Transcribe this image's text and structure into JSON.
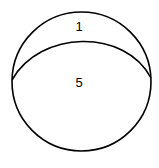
{
  "diagram": {
    "type": "circle-partition",
    "regions": [
      {
        "id": "top",
        "label": "1"
      },
      {
        "id": "bottom",
        "label": "5"
      }
    ],
    "stroke_color": "#000000",
    "background": "#ffffff"
  }
}
